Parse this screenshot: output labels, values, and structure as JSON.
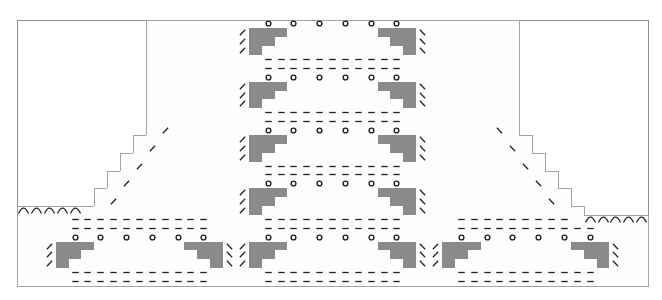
{
  "chart_title": "",
  "grid": {
    "cols": 49,
    "rows": 30,
    "origin_x": 17,
    "origin_y": 19.5,
    "cell_w": 12.878,
    "cell_h": 8.883,
    "colors": {
      "line": "#a3a3a3",
      "frame": "#8f8f8f",
      "filled": "#8a8a8a",
      "symbol": "#222222",
      "background": "#ffffff"
    }
  },
  "row_extents": [
    {
      "rows": [
        0,
        12
      ],
      "from": 10,
      "to": 38
    },
    {
      "rows": [
        13,
        14
      ],
      "from": 9,
      "to": 39
    },
    {
      "rows": [
        15,
        16
      ],
      "from": 8,
      "to": 40
    },
    {
      "rows": [
        17,
        18
      ],
      "from": 7,
      "to": 41
    },
    {
      "rows": [
        19,
        20
      ],
      "from": 6,
      "to": 42
    },
    {
      "rows": [
        21,
        21
      ],
      "from": 0,
      "to": 43
    },
    {
      "rows": [
        22,
        29
      ],
      "from": 0,
      "to": 48
    }
  ],
  "legend_symbols": {
    "o": "yarn-over",
    "/": "right-leaning decrease",
    "\\": "left-leaning decrease",
    "-": "purl",
    "arc": "cast-on / bind-off arc",
    "gray": "no stitch"
  },
  "motifs": [
    {
      "name": "upper-1",
      "row": 0,
      "left": 17
    },
    {
      "name": "upper-2",
      "row": 6,
      "left": 17
    },
    {
      "name": "upper-3",
      "row": 12,
      "left": 17
    },
    {
      "name": "upper-4",
      "row": 18,
      "left": 17
    },
    {
      "name": "bottom-A",
      "row": 24,
      "left": 2
    },
    {
      "name": "bottom-B",
      "row": 24,
      "left": 17
    },
    {
      "name": "bottom-C",
      "row": 24,
      "left": 32
    }
  ],
  "motif_template": {
    "width": 15,
    "yo_offsets": [
      2,
      4,
      6,
      8,
      10,
      12
    ],
    "dash_span_offset": [
      2,
      12
    ],
    "gray_rows": [
      {
        "dr": 1,
        "left": [
          1,
          3
        ],
        "right": [
          11,
          13
        ]
      },
      {
        "dr": 2,
        "left": [
          1,
          2
        ],
        "right": [
          12,
          13
        ]
      },
      {
        "dr": 3,
        "left": [
          1,
          1
        ],
        "right": [
          13,
          13
        ]
      }
    ],
    "dash_rows_before": [
      -2,
      -1
    ]
  },
  "extra_dashes": [
    {
      "row": 28,
      "from": 4,
      "to": 14
    },
    {
      "row": 29,
      "from": 4,
      "to": 14
    },
    {
      "row": 28,
      "from": 19,
      "to": 29
    },
    {
      "row": 29,
      "from": 19,
      "to": 29
    },
    {
      "row": 28,
      "from": 34,
      "to": 44
    },
    {
      "row": 29,
      "from": 34,
      "to": 44
    },
    {
      "row": 22,
      "from": 4,
      "to": 14
    },
    {
      "row": 23,
      "from": 4,
      "to": 14
    },
    {
      "row": 22,
      "from": 34,
      "to": 42
    },
    {
      "row": 23,
      "from": 34,
      "to": 44
    }
  ],
  "slashes": [
    {
      "row": 12,
      "col": 11,
      "dir": "/"
    },
    {
      "row": 14,
      "col": 10,
      "dir": "/"
    },
    {
      "row": 16,
      "col": 9,
      "dir": "/"
    },
    {
      "row": 18,
      "col": 8,
      "dir": "/"
    },
    {
      "row": 20,
      "col": 7,
      "dir": "/"
    },
    {
      "row": 12,
      "col": 37,
      "dir": "\\"
    },
    {
      "row": 14,
      "col": 38,
      "dir": "\\"
    },
    {
      "row": 16,
      "col": 39,
      "dir": "\\"
    },
    {
      "row": 18,
      "col": 40,
      "dir": "\\"
    },
    {
      "row": 20,
      "col": 41,
      "dir": "\\"
    }
  ],
  "arcs": [
    {
      "row": 21,
      "cols": [
        0,
        1,
        2,
        3,
        4
      ]
    },
    {
      "row": 22,
      "cols": [
        44,
        45,
        46,
        47,
        48
      ]
    }
  ]
}
